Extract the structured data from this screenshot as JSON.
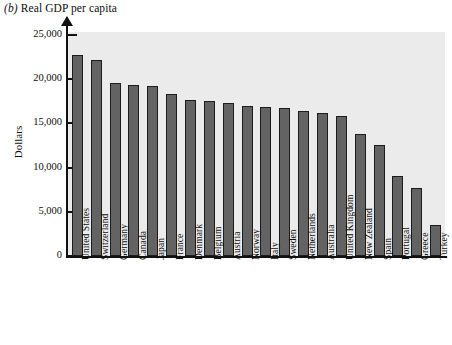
{
  "chart_data": {
    "type": "bar",
    "panel_letter": "(b)",
    "title": "(b) Real GDP per capita",
    "title_text": "Real GDP per capita",
    "xlabel": "",
    "ylabel": "Dollars",
    "ylim": [
      0,
      25000
    ],
    "ytick_values": [
      0,
      5000,
      10000,
      15000,
      20000,
      25000
    ],
    "ytick_labels": [
      "0",
      "5,000",
      "10,000",
      "15,000",
      "20,000",
      "25,000"
    ],
    "grid": false,
    "legend": null,
    "bar_color": "#636363",
    "bar_edge_color": "#1c1c1c",
    "plot_background": "#ebebeb",
    "categories": [
      "United States",
      "Switzerland",
      "Germany",
      "Canada",
      "Japan",
      "France",
      "Denmark",
      "Belgium",
      "Austria",
      "Norway",
      "Italy",
      "Sweden",
      "Netherlands",
      "Australia",
      "United Kingdom",
      "New Zealand",
      "Spain",
      "Portugal",
      "Greece",
      "Turkey"
    ],
    "values": [
      22700,
      22200,
      19600,
      19400,
      19200,
      18300,
      17700,
      17500,
      17300,
      17000,
      16900,
      16700,
      16400,
      16200,
      15800,
      13800,
      12600,
      9000,
      7700,
      3500
    ]
  }
}
